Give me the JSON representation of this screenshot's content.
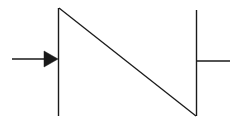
{
  "diagram": {
    "type": "schematic-symbol",
    "stroke_color": "#1a1a1a",
    "background": "#ffffff",
    "elements": {
      "input_lead": {
        "x1": 12,
        "y1": 59,
        "x2": 46,
        "y2": 59
      },
      "input_arrow": {
        "points": "44,51 58,59 44,67"
      },
      "left_bar": {
        "x1": 58.5,
        "y1": 8,
        "x2": 58.5,
        "y2": 116
      },
      "diagonal": {
        "x1": 59,
        "y1": 8,
        "x2": 196,
        "y2": 116
      },
      "right_bar": {
        "x1": 196.5,
        "y1": 10,
        "x2": 196.5,
        "y2": 116
      },
      "output_lead": {
        "x1": 197,
        "y1": 61,
        "x2": 230,
        "y2": 61
      }
    }
  }
}
